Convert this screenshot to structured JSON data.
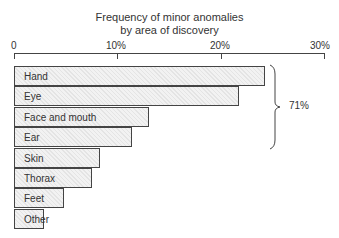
{
  "chart_data": {
    "type": "bar",
    "orientation": "horizontal",
    "title_lines": [
      "Frequency of minor anomalies",
      "by area of discovery"
    ],
    "xlabel": "",
    "ylabel": "",
    "xlim": [
      0,
      30
    ],
    "x_ticks": [
      "0",
      "10%",
      "20%",
      "30%"
    ],
    "grid": false,
    "legend": null,
    "categories": [
      "Hand",
      "Eye",
      "Face and mouth",
      "Ear",
      "Skin",
      "Thorax",
      "Feet",
      "Other"
    ],
    "values": [
      24.3,
      21.8,
      13.1,
      11.4,
      8.3,
      7.5,
      4.8,
      2.9
    ],
    "annotations": [
      {
        "text": "71%",
        "type": "brace",
        "spans": [
          "Hand",
          "Eye",
          "Face and mouth",
          "Ear"
        ]
      }
    ]
  },
  "colors": {
    "bar_fill": "#ececec",
    "bar_border": "#444444",
    "text": "#333333"
  }
}
